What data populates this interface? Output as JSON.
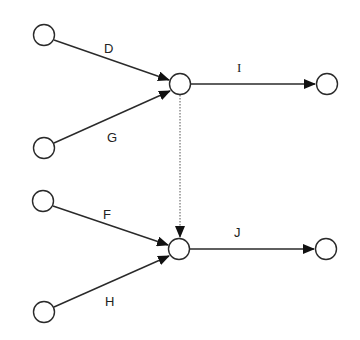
{
  "diagram": {
    "type": "activity-on-arrow network",
    "nodes": [
      {
        "id": "n1",
        "x": 44,
        "y": 35
      },
      {
        "id": "n2",
        "x": 44,
        "y": 148
      },
      {
        "id": "n3",
        "x": 180,
        "y": 84
      },
      {
        "id": "n4",
        "x": 327,
        "y": 84
      },
      {
        "id": "n5",
        "x": 43,
        "y": 201
      },
      {
        "id": "n6",
        "x": 44,
        "y": 312
      },
      {
        "id": "n7",
        "x": 179,
        "y": 249
      },
      {
        "id": "n8",
        "x": 326,
        "y": 249
      }
    ],
    "edges": [
      {
        "label": "D",
        "from": "n1",
        "to": "n3",
        "style": "solid"
      },
      {
        "label": "G",
        "from": "n2",
        "to": "n3",
        "style": "solid"
      },
      {
        "label": "I",
        "from": "n3",
        "to": "n4",
        "style": "solid"
      },
      {
        "label": "",
        "from": "n3",
        "to": "n7",
        "style": "dotted",
        "note": "dummy activity"
      },
      {
        "label": "F",
        "from": "n5",
        "to": "n7",
        "style": "solid"
      },
      {
        "label": "H",
        "from": "n6",
        "to": "n7",
        "style": "solid"
      },
      {
        "label": "J",
        "from": "n7",
        "to": "n8",
        "style": "solid"
      }
    ],
    "labels": {
      "D": "D",
      "G": "G",
      "I": "I",
      "F": "F",
      "H": "H",
      "J": "J"
    },
    "colors": {
      "stroke": "#2a2a2a",
      "background": "#ffffff"
    }
  }
}
